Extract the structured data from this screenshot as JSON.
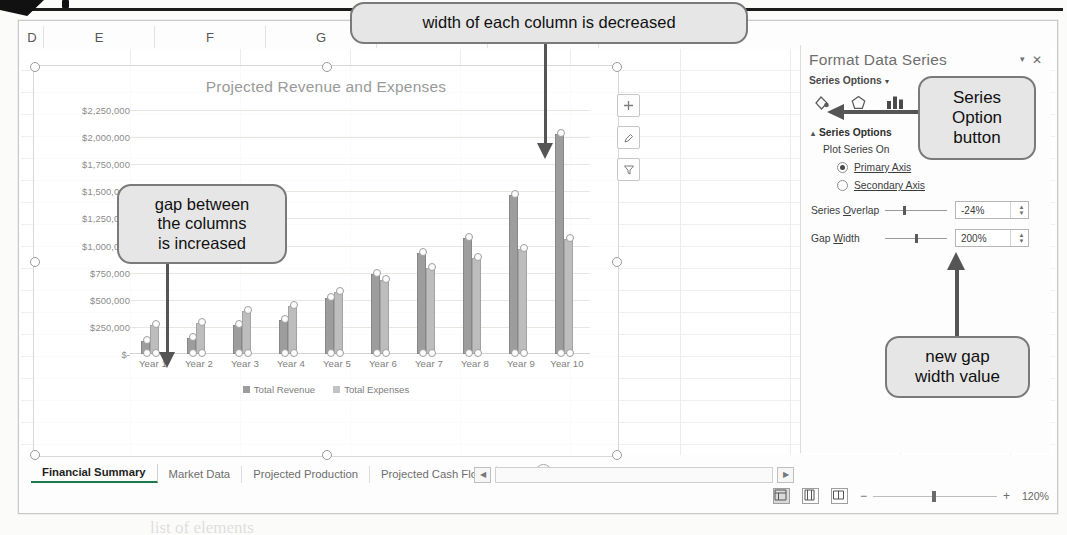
{
  "window": {
    "column_headers": [
      "D",
      "E",
      "F",
      "G",
      "H",
      "I"
    ]
  },
  "chart": {
    "title": "Projected Revenue and Expenses",
    "element_buttons": [
      {
        "name": "chart-elements",
        "glyph": "+"
      },
      {
        "name": "chart-styles",
        "glyph": "✎"
      },
      {
        "name": "chart-filters",
        "glyph": "ᐱ"
      }
    ]
  },
  "chart_data": {
    "type": "bar",
    "title": "Projected Revenue and Expenses",
    "xlabel": "",
    "ylabel": "",
    "categories": [
      "Year 1",
      "Year 2",
      "Year 3",
      "Year 4",
      "Year 5",
      "Year 6",
      "Year 7",
      "Year 8",
      "Year 9",
      "Year 10"
    ],
    "ytick_labels": [
      "$2,250,000",
      "$2,000,000",
      "$1,750,000",
      "$1,500,000",
      "$1,250,000",
      "$1,000,000",
      "$750,000",
      "$500,000",
      "$250,000",
      "$-"
    ],
    "ytick_values": [
      2250000,
      2000000,
      1750000,
      1500000,
      1250000,
      1000000,
      750000,
      500000,
      250000,
      0
    ],
    "ylim": [
      0,
      2250000
    ],
    "grid": true,
    "legend_position": "bottom",
    "series": [
      {
        "name": "Total Revenue",
        "values": [
          120000,
          150000,
          270000,
          310000,
          520000,
          740000,
          930000,
          1070000,
          1470000,
          2025000
        ]
      },
      {
        "name": "Total Expenses",
        "values": [
          270000,
          290000,
          400000,
          440000,
          570000,
          680000,
          790000,
          890000,
          970000,
          1060000
        ]
      }
    ]
  },
  "pane": {
    "title": "Format Data Series",
    "close_label": "✕",
    "caret_label": "▾",
    "subtitle": "Series Options",
    "subtitle_caret": "▾",
    "icons": [
      {
        "name": "fill-line-icon"
      },
      {
        "name": "effects-icon"
      },
      {
        "name": "series-options-icon"
      }
    ],
    "section_title": "Series Options",
    "section_caret": "▴",
    "plot_series_on_label": "Plot Series On",
    "radio_primary": "Primary Axis",
    "radio_secondary": "Secondary Axis",
    "series_overlap_label_pre": "Series ",
    "series_overlap_label_key": "O",
    "series_overlap_label_post": "verlap",
    "series_overlap_value": "-24%",
    "gap_width_label_pre": "Gap ",
    "gap_width_label_key": "W",
    "gap_width_label_post": "idth",
    "gap_width_value": "200%"
  },
  "sheet_tabs": {
    "tabs": [
      "Financial Summary",
      "Market Data",
      "Projected Production",
      "Projected Cash Flow"
    ],
    "overflow": "...",
    "add_label": "+"
  },
  "status": {
    "zoom": "120%",
    "zoom_out": "−",
    "zoom_in": "+",
    "views": [
      "normal-view",
      "page-layout-view",
      "page-break-view"
    ]
  },
  "callouts": [
    {
      "id": "col-width",
      "text": "width of each column is decreased"
    },
    {
      "id": "gap-columns",
      "text": "gap between\nthe columns\nis increased"
    },
    {
      "id": "series-option",
      "text": "Series\nOption\nbutton"
    },
    {
      "id": "new-gap-value",
      "text": "new gap\nwidth value"
    }
  ],
  "background_text": {
    "lines": [
      "holds the  chart plotted and the",
      "in our data blocks are created",
      "the Format",
      "then right-click and choose",
      "ly, and then click almost anywhere",
      "with the  data is marked"
    ],
    "bottom_lines": [
      "To add a data series to the chart",
      "1. With the chart selected, use the",
      "mouse to select only the new section",
      "2. Click the Chart Elements button to bring up the",
      "list of elements"
    ]
  }
}
